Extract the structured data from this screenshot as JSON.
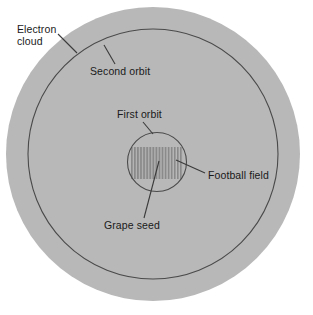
{
  "figure": {
    "background_color": "#ffffff",
    "cloud_fill": "#b8b8b8",
    "stripe_color": "#8a8a8a",
    "line_color": "#4a4a4a",
    "text_color": "#1a1a1a"
  },
  "labels": {
    "electron_cloud": "Electron\ncloud",
    "electron_cloud_line1": "Electron",
    "electron_cloud_line2": "cloud",
    "second_orbit": "Second orbit",
    "first_orbit": "First orbit",
    "football_field": "Football field",
    "grape_seed": "Grape seed"
  },
  "shapes": {
    "electron_cloud_circle": {
      "cx": 153,
      "cy": 154,
      "r": 147,
      "fill": "#b8b8b8"
    },
    "second_orbit_circle": {
      "cx": 153,
      "cy": 154,
      "r": 125,
      "stroke": "#4a4a4a"
    },
    "first_orbit_circle": {
      "cx": 157,
      "cy": 162,
      "r": 29.5,
      "stroke": "#4a4a4a"
    },
    "football_field_rect": {
      "x": 131,
      "y": 147,
      "width": 52,
      "height": 32,
      "stripes": 17
    }
  },
  "leader_lines": {
    "electron_cloud": {
      "x1": 58,
      "y1": 34,
      "x2": 77,
      "y2": 53
    },
    "second_orbit": {
      "x1": 115,
      "y1": 64,
      "x2": 104,
      "y2": 45
    },
    "first_orbit": {
      "x1": 143,
      "y1": 122,
      "x2": 153,
      "y2": 134
    },
    "football_field": {
      "x1": 205,
      "y1": 173,
      "x2": 176,
      "y2": 160
    },
    "grape_seed": {
      "x1": 144,
      "y1": 218,
      "x2": 159,
      "y2": 161
    }
  }
}
